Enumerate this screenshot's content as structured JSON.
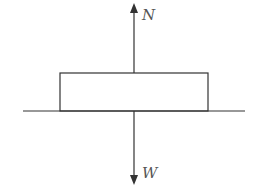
{
  "diagram": {
    "type": "free-body diagram",
    "forces": [
      {
        "label": "N",
        "direction": "up",
        "meaning": "normal force"
      },
      {
        "label": "W",
        "direction": "down",
        "meaning": "weight"
      }
    ],
    "object": "rectangular block resting on horizontal surface",
    "colors": {
      "stroke": "#333333",
      "label": "#555555",
      "background": "#ffffff"
    }
  }
}
